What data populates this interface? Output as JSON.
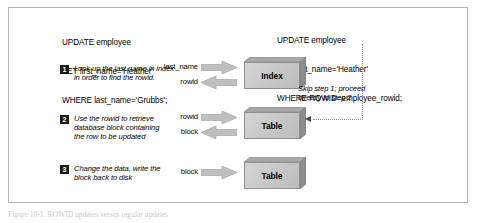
{
  "figure": {
    "caption": "Figure 10-1. ROWID updates versus regular updates"
  },
  "sql_left": {
    "name": "sql-statement-left",
    "lines": [
      "UPDATE employee",
      "SET first_name='Heather'",
      "WHERE last_name='Grubbs';"
    ]
  },
  "sql_right": {
    "name": "sql-statement-right",
    "lines": [
      "UPDATE employee",
      "SET first_name='Heather'",
      "WHERE ROWID=employee_rowid;"
    ]
  },
  "steps": [
    {
      "number": "1",
      "text": "Look up the last name in index\nin order to find the rowid."
    },
    {
      "number": "2",
      "text": "Use the rowid to retrieve\ndatabase block containing\nthe row to be updated"
    },
    {
      "number": "3",
      "text": "Change the data, write the\nblock back to disk"
    }
  ],
  "flows": [
    {
      "label": "last_name",
      "direction": "right"
    },
    {
      "label": "rowid",
      "direction": "left"
    },
    {
      "label": "rowid",
      "direction": "right"
    },
    {
      "label": "block",
      "direction": "left"
    },
    {
      "label": "block",
      "direction": "right"
    }
  ],
  "boxes": [
    {
      "label": "Index"
    },
    {
      "label": "Table"
    },
    {
      "label": "Table"
    }
  ],
  "skip_note": {
    "text": "Skip step 1; proceed\ndirectly to step 2"
  },
  "colors": {
    "box_fill": "#c6c6c6",
    "box_border": "#8f8f8f",
    "arrow_fill": "#bfbfbf",
    "badge_fill": "#1b1b1b",
    "frame_border": "#b4b4b4",
    "dotted_line": "#8c8c8c"
  }
}
